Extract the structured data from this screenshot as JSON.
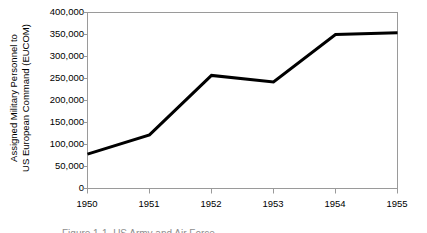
{
  "chart_data": {
    "type": "line",
    "title": "",
    "xlabel": "",
    "ylabel": "Assigned Military Personnel to US European Command (EUCOM)",
    "ylabel_line1": "Assigned Military Personnel to",
    "ylabel_line2": "US European Command (EUCOM)",
    "categories": [
      "1950",
      "1951",
      "1952",
      "1953",
      "1954",
      "1955"
    ],
    "x": [
      1950,
      1951,
      1952,
      1953,
      1954,
      1955
    ],
    "values": [
      78000,
      122000,
      257000,
      242000,
      350000,
      354000
    ],
    "series": [
      {
        "name": "Assigned Military Personnel to US European Command (EUCOM)",
        "values": [
          78000,
          122000,
          257000,
          242000,
          350000,
          354000
        ]
      }
    ],
    "ylim": [
      0,
      400000
    ],
    "xlim": [
      1950,
      1955
    ],
    "ytick_labels": [
      "0",
      "50,000",
      "100,000",
      "150,000",
      "200,000",
      "250,000",
      "300,000",
      "350,000",
      "400,000"
    ],
    "ytick_values": [
      0,
      50000,
      100000,
      150000,
      200000,
      250000,
      300000,
      350000,
      400000
    ],
    "xtick_labels": [
      "1950",
      "1951",
      "1952",
      "1953",
      "1954",
      "1955"
    ],
    "grid": false,
    "legend": false,
    "legend_position": "none",
    "line_color": "#000000",
    "axis_color": "#9a9a9a",
    "background_color": "#ffffff",
    "markers": false
  },
  "figure": {
    "caption_clipped": "Figure 1-1. US Army and Air Force"
  }
}
